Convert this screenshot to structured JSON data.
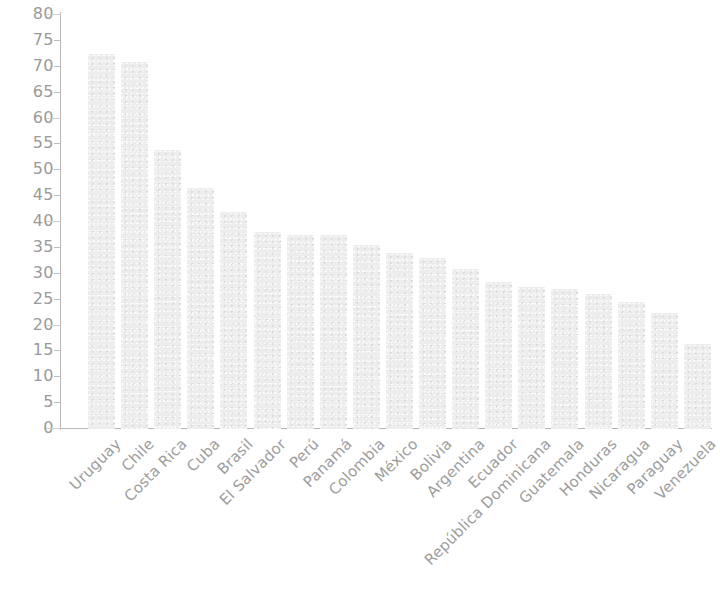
{
  "chart_data": {
    "type": "bar",
    "title": "",
    "subtitle": "",
    "xlabel": "",
    "ylabel": "",
    "ylim": [
      0,
      80
    ],
    "ytick_step": 5,
    "grid": false,
    "legend": false,
    "bar_color": "#ededed",
    "axis_color": "#b9b9b9",
    "label_color": "#9d9d9d",
    "ytick_labels": [
      "80",
      "75",
      "70",
      "65",
      "60",
      "55",
      "50",
      "45",
      "40",
      "35",
      "30",
      "25",
      "20",
      "15",
      "10",
      "5",
      "0"
    ],
    "ytick_values": [
      80,
      75,
      70,
      65,
      60,
      55,
      50,
      45,
      40,
      35,
      30,
      25,
      20,
      15,
      10,
      5,
      0
    ],
    "categories": [
      "Uruguay",
      "Chile",
      "Costa Rica",
      "Cuba",
      "Brasil",
      "El Salvador",
      "Perú",
      "Panamá",
      "Colombia",
      "México",
      "Bolivia",
      "Argentina",
      "Ecuador",
      "República Dominicana",
      "Guatemala",
      "Honduras",
      "Nicaragua",
      "Paraguay",
      "Venezuela"
    ],
    "values": [
      72.5,
      71,
      54,
      46.5,
      42,
      38,
      37.5,
      37.5,
      35.5,
      34,
      33,
      31,
      28.5,
      27.5,
      27,
      26,
      24.5,
      22.5,
      16.5
    ]
  }
}
